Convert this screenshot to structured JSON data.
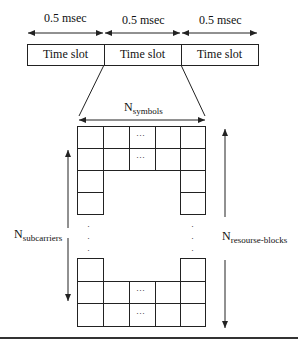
{
  "timeline": {
    "durations": [
      "0.5 msec",
      "0.5 msec",
      "0.5 msec"
    ],
    "slots": [
      "Time slot",
      "Time slot",
      "Time slot"
    ]
  },
  "grid": {
    "symbols_label": {
      "main": "N",
      "sub": "symbols"
    },
    "subcarriers_label": {
      "main": "N",
      "sub": "subcarriers"
    },
    "resource_blocks_label": {
      "main": "N",
      "sub": "resourse-blocks"
    },
    "ellipsis": "···",
    "vertical_dots": "·"
  },
  "colors": {
    "line": "#222222",
    "background": "#ffffff"
  }
}
